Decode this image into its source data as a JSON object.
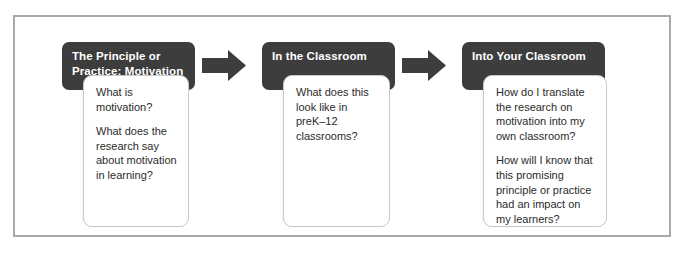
{
  "diagram": {
    "frame_color": "#a9a9a9",
    "header_color": "#3d3d3d",
    "arrow_color": "#3d3d3d",
    "stages": [
      {
        "header": "The Principle or Practice: Motivation",
        "questions": [
          "What is motivation?",
          "What does the research say about motivation in learning?"
        ]
      },
      {
        "header": "In the Classroom",
        "questions": [
          "What does this look like in preK–12 classrooms?"
        ]
      },
      {
        "header": "Into Your Classroom",
        "questions": [
          "How do I translate the research on motivation into my own classroom?",
          "How will I know that this promising principle or practice had an impact on my learners?"
        ]
      }
    ],
    "arrows": [
      {
        "name": "arrow-stage1-to-stage2"
      },
      {
        "name": "arrow-stage2-to-stage3"
      }
    ]
  }
}
